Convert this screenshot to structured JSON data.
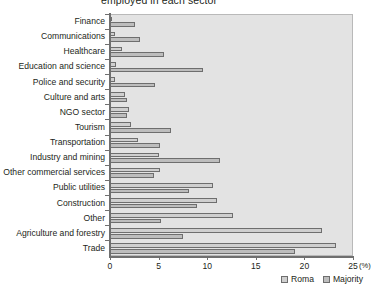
{
  "chart_data": {
    "type": "bar",
    "orientation": "horizontal",
    "title": "employed in each sector",
    "xlabel": "(%)",
    "ylabel": "",
    "xlim": [
      0,
      25
    ],
    "xticks": [
      0,
      5,
      10,
      15,
      20,
      25
    ],
    "grid": false,
    "legend_position": "bottom-right",
    "categories": [
      "Finance",
      "Communications",
      "Healthcare",
      "Education and science",
      "Police and security",
      "Culture and arts",
      "NGO sector",
      "Tourism",
      "Transportation",
      "Industry and mining",
      "Other commercial services",
      "Public utilities",
      "Construction",
      "Other",
      "Agriculture and forestry",
      "Trade"
    ],
    "series": [
      {
        "name": "Roma",
        "color": "#cfcfcf",
        "values": [
          0.2,
          0.5,
          1.2,
          0.6,
          0.5,
          1.5,
          2.0,
          2.2,
          2.9,
          5.0,
          5.1,
          10.6,
          11.0,
          12.7,
          21.8,
          23.2
        ]
      },
      {
        "name": "Majority",
        "color": "#bdbdbd",
        "values": [
          2.6,
          3.1,
          5.6,
          9.6,
          4.6,
          1.8,
          1.7,
          6.3,
          5.1,
          11.3,
          4.5,
          8.1,
          8.9,
          5.2,
          7.5,
          19.0
        ]
      }
    ]
  },
  "legend": {
    "items": [
      {
        "label": "Roma",
        "color": "#cfcfcf"
      },
      {
        "label": "Majority",
        "color": "#bdbdbd"
      }
    ]
  },
  "colors": {
    "plot_background": "#e3e3e3",
    "axis": "#6f6f6f",
    "bar_outline": "#6e6e6e",
    "text": "#231f20"
  }
}
